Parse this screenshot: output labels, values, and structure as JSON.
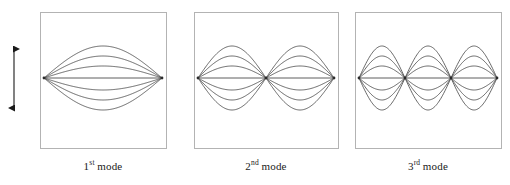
{
  "figure": {
    "name": "vibration-mode-shapes",
    "background_color": "#ffffff",
    "line_color": "#4d4d4d",
    "box_color": "#b3b3b3",
    "arrow_color": "#1a1a1a",
    "arrow": {
      "name": "vertical-double-headed-arrow",
      "orientation": "vertical",
      "x": 14,
      "y_top": 45,
      "y_bottom": 112
    },
    "panels": [
      {
        "id": "panel-1",
        "caption_ordinal": "1",
        "caption_suffix": "st",
        "caption_word": "mode",
        "half_waves": 1,
        "box": {
          "x": 40,
          "y": 12,
          "width": 126,
          "height": 136
        },
        "wave": {
          "x_start": 44,
          "x_end": 162,
          "y_center": 78,
          "amplitudes": [
            0,
            12,
            22,
            32
          ],
          "curve_count": 7,
          "nodes_interior": []
        }
      },
      {
        "id": "panel-2",
        "caption_ordinal": "2",
        "caption_suffix": "nd",
        "caption_word": "mode",
        "half_waves": 2,
        "box": {
          "x": 194,
          "y": 12,
          "width": 144,
          "height": 136
        },
        "wave": {
          "x_start": 198,
          "x_end": 334,
          "y_center": 78,
          "amplitudes": [
            0,
            12,
            22,
            32
          ],
          "curve_count": 7,
          "nodes_interior": [
            266
          ]
        }
      },
      {
        "id": "panel-3",
        "caption_ordinal": "3",
        "caption_suffix": "rd",
        "caption_word": "mode",
        "half_waves": 3,
        "box": {
          "x": 355,
          "y": 12,
          "width": 146,
          "height": 136
        },
        "wave": {
          "x_start": 359,
          "x_end": 497,
          "y_center": 78,
          "amplitudes": [
            0,
            12,
            22,
            32
          ],
          "curve_count": 7,
          "nodes_interior": [
            405,
            451
          ]
        }
      }
    ]
  },
  "chart_data": {
    "type": "line",
    "title": "",
    "xlabel": "",
    "ylabel": "",
    "series": [
      {
        "name": "1st mode",
        "half_waves": 1,
        "shape": "sin(pi*x/L)",
        "amplitude_levels": [
          0,
          12,
          22,
          32
        ],
        "amplitude_levels_signed": [
          -32,
          -22,
          -12,
          0,
          12,
          22,
          32
        ],
        "interior_nodes": 0
      },
      {
        "name": "2nd mode",
        "half_waves": 2,
        "shape": "sin(2*pi*x/L)",
        "amplitude_levels": [
          0,
          12,
          22,
          32
        ],
        "amplitude_levels_signed": [
          -32,
          -22,
          -12,
          0,
          12,
          22,
          32
        ],
        "interior_nodes": 1
      },
      {
        "name": "3rd mode",
        "half_waves": 3,
        "shape": "sin(3*pi*x/L)",
        "amplitude_levels": [
          0,
          12,
          22,
          32
        ],
        "amplitude_levels_signed": [
          -32,
          -22,
          -12,
          0,
          12,
          22,
          32
        ],
        "interior_nodes": 2
      }
    ],
    "legend_position": "below-each-panel",
    "grid": false,
    "annotations": [
      {
        "name": "oscillation-direction-arrow",
        "text": "",
        "type": "double-headed-vertical-arrow"
      }
    ]
  }
}
